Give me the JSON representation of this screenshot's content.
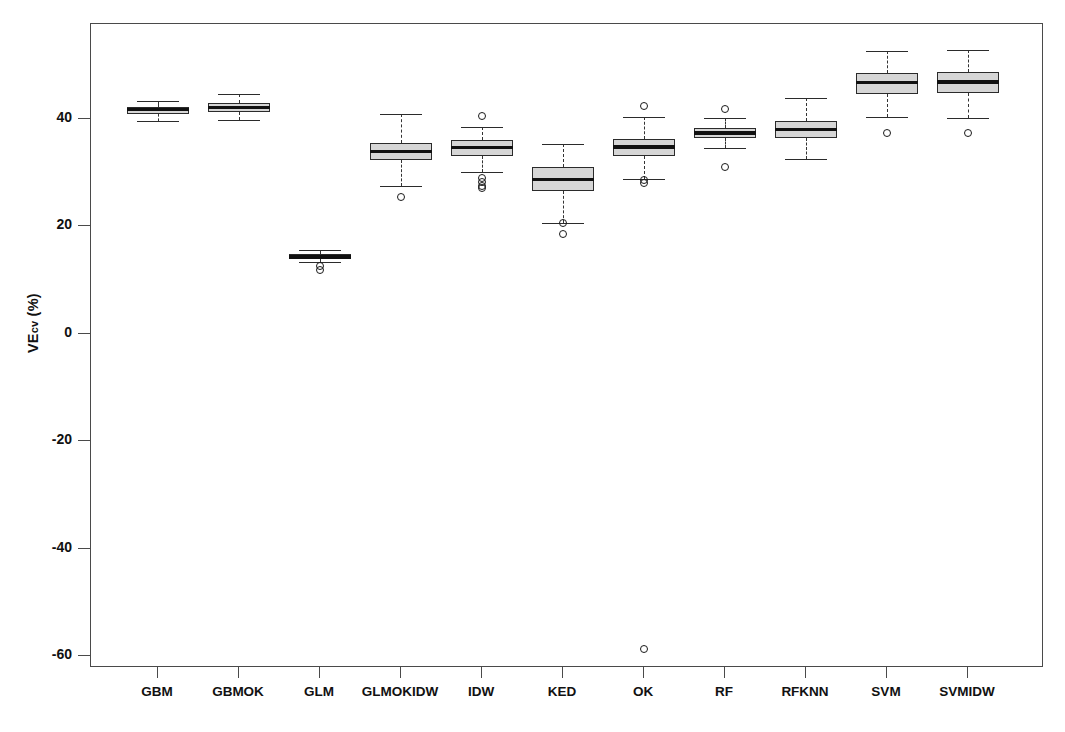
{
  "chart_data": {
    "type": "box",
    "title": "",
    "xlabel": "",
    "ylabel": "VEcv (%)",
    "ylabel_main": "VE",
    "ylabel_sub": "cv",
    "ylabel_unit": " (%)",
    "grid": false,
    "legend": "none",
    "ylim": [
      -65,
      57
    ],
    "yticks": [
      40,
      20,
      0,
      -20,
      -40,
      -60
    ],
    "ytick_labels": [
      "40",
      "20",
      "0",
      "-20",
      "-40",
      "-60"
    ],
    "categories": [
      "GBM",
      "GBMOK",
      "GLM",
      "GLMOKIDW",
      "IDW",
      "KED",
      "OK",
      "RF",
      "RFKNN",
      "SVM",
      "SVMIDW"
    ],
    "boxes": [
      {
        "label": "GBM",
        "whisker_low": 39.6,
        "q1": 41.0,
        "median": 41.7,
        "q3": 42.3,
        "whisker_high": 43.4,
        "outliers": []
      },
      {
        "label": "GBMOK",
        "whisker_low": 39.9,
        "q1": 41.3,
        "median": 42.1,
        "q3": 42.9,
        "whisker_high": 44.6,
        "outliers": []
      },
      {
        "label": "GLM",
        "whisker_low": 13.3,
        "q1": 13.9,
        "median": 14.3,
        "q3": 14.8,
        "whisker_high": 15.6,
        "outliers": [
          12.6,
          11.9
        ]
      },
      {
        "label": "GLMOKIDW",
        "whisker_low": 27.5,
        "q1": 32.3,
        "median": 34.0,
        "q3": 35.6,
        "whisker_high": 41.0,
        "outliers": [
          25.5
        ]
      },
      {
        "label": "IDW",
        "whisker_low": 30.1,
        "q1": 33.2,
        "median": 34.7,
        "q3": 36.0,
        "whisker_high": 38.5,
        "outliers": [
          40.6,
          29.0,
          28.2,
          27.5,
          27.1
        ]
      },
      {
        "label": "KED",
        "whisker_low": 20.7,
        "q1": 26.6,
        "median": 28.8,
        "q3": 31.0,
        "whisker_high": 35.4,
        "outliers": [
          20.6,
          18.5
        ]
      },
      {
        "label": "OK",
        "whisker_low": 28.8,
        "q1": 33.1,
        "median": 34.8,
        "q3": 36.2,
        "whisker_high": 40.3,
        "outliers": [
          42.5,
          28.6,
          28.0,
          -58.7
        ]
      },
      {
        "label": "RF",
        "whisker_low": 34.6,
        "q1": 36.5,
        "median": 37.4,
        "q3": 38.4,
        "whisker_high": 40.2,
        "outliers": [
          41.9,
          31.1
        ]
      },
      {
        "label": "RFKNN",
        "whisker_low": 32.5,
        "q1": 36.5,
        "median": 38.0,
        "q3": 39.6,
        "whisker_high": 44.0,
        "outliers": []
      },
      {
        "label": "SVM",
        "whisker_low": 40.4,
        "q1": 44.7,
        "median": 46.8,
        "q3": 48.6,
        "whisker_high": 52.6,
        "outliers": [
          37.4
        ]
      },
      {
        "label": "SVMIDW",
        "whisker_low": 40.1,
        "q1": 44.8,
        "median": 46.9,
        "q3": 48.7,
        "whisker_high": 52.8,
        "outliers": [
          37.4
        ]
      }
    ]
  },
  "style": {
    "box_fill": "#d6d6d6",
    "line_color": "#2b2b2b",
    "axis_color": "#4a4a4a",
    "text_color": "#111111",
    "background": "#ffffff"
  }
}
